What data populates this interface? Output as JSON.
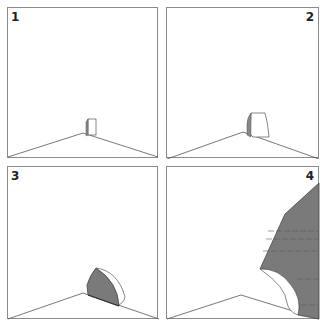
{
  "figure": {
    "colors": {
      "border": "#8a8a8a",
      "line": "#555555",
      "fill": "#7a7a7a",
      "background": "#ffffff"
    },
    "panels": [
      {
        "label": "1",
        "label_position": "top-left"
      },
      {
        "label": "2",
        "label_position": "top-right"
      },
      {
        "label": "3",
        "label_position": "top-left"
      },
      {
        "label": "4",
        "label_position": "top-right"
      }
    ]
  }
}
